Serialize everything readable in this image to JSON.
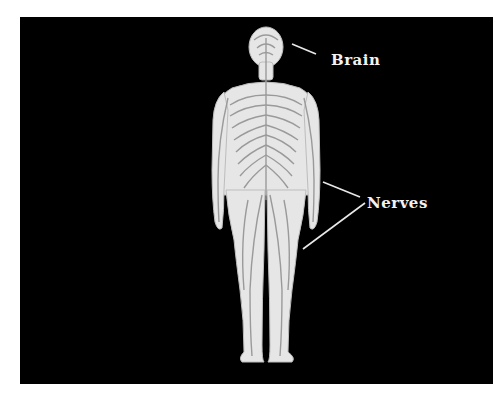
{
  "diagram": {
    "background_color": "#000000",
    "body_color": "#e6e6e6",
    "nerve_color": "#9a9a9a",
    "labels": [
      {
        "text": "Brain",
        "x": 331,
        "y": 51
      },
      {
        "text": "Nerves",
        "x": 367,
        "y": 194
      }
    ],
    "pointer_lines": [
      {
        "target": "Brain",
        "from": [
          292,
          44
        ],
        "to": [
          316,
          54
        ]
      },
      {
        "target": "Nerves",
        "from": [
          323,
          182
        ],
        "to": [
          360,
          197
        ]
      },
      {
        "target": "Nerves",
        "from": [
          303,
          249
        ],
        "to": [
          365,
          203
        ]
      }
    ]
  }
}
